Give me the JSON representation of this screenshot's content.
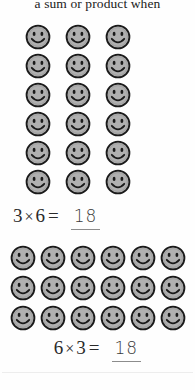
{
  "page": {
    "heading_text": "a sum or product when",
    "background_color": "#fefefe",
    "text_color": "#1b1b1b"
  },
  "smiley": {
    "icon_name": "smiley-face-icon",
    "fill_color": "#b0b0b0",
    "stroke_color": "#1a1a1a",
    "shade_color": "#9a9a9a"
  },
  "arrays": [
    {
      "id": "array-3-by-6",
      "columns": 3,
      "rows": 6,
      "total": 18,
      "label": "3 by 6 array of smiley faces"
    },
    {
      "id": "array-6-by-3",
      "columns": 6,
      "rows": 3,
      "total": 18,
      "label": "6 by 3 array of smiley faces"
    }
  ],
  "equations": [
    {
      "id": "equation-3-times-6",
      "left_factor": "3",
      "operator": "×",
      "right_factor": "6",
      "equals": "=",
      "answer": "18"
    },
    {
      "id": "equation-6-times-3",
      "left_factor": "6",
      "operator": "×",
      "right_factor": "3",
      "equals": "=",
      "answer": "18"
    }
  ]
}
